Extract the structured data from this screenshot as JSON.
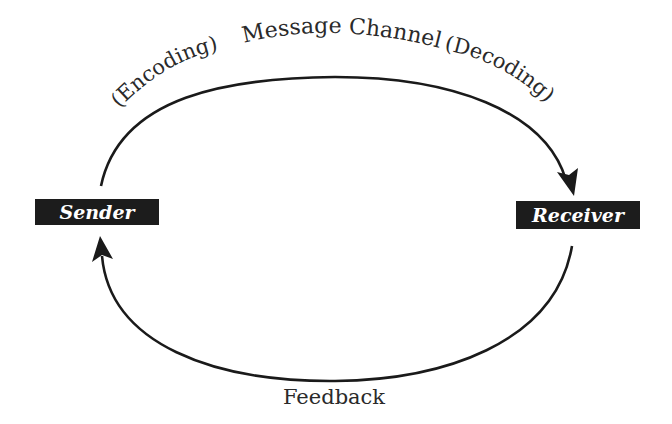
{
  "diagram": {
    "type": "communication-cycle",
    "nodes": {
      "sender": {
        "label": "Sender"
      },
      "receiver": {
        "label": "Receiver"
      }
    },
    "top_arc": {
      "left_label": "(Encoding)",
      "center_label": "Message Channel",
      "right_label": "(Decoding)",
      "direction": "sender-to-receiver"
    },
    "bottom_arc": {
      "label": "Feedback",
      "direction": "receiver-to-sender"
    },
    "colors": {
      "box_fill": "#1c1c1c",
      "box_text": "#ffffff",
      "line": "#1a1a1a",
      "text": "#2a2a2a",
      "background": "#ffffff"
    }
  }
}
